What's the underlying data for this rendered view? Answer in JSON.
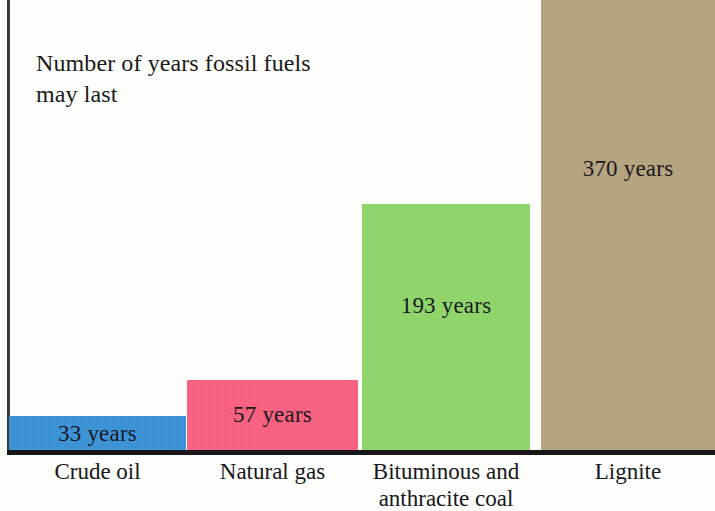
{
  "chart_data": {
    "type": "bar",
    "title": "Number of years fossil fuels\nmay last",
    "xlabel": "",
    "ylabel": "",
    "grid": false,
    "legend": "none",
    "ylim": [
      0,
      370
    ],
    "categories": [
      "Crude oil",
      "Natural gas",
      "Bituminous and\nanthracite coal",
      "Lignite"
    ],
    "values": [
      33,
      57,
      193,
      370
    ],
    "value_labels": [
      "33 years",
      "57 years",
      "193 years",
      "370 years"
    ],
    "colors": [
      "#3b92d6",
      "#f9617f",
      "#8ed66a",
      "#b5a47e"
    ],
    "units": "years"
  },
  "chart": {
    "title": "Number of years fossil fuels\nmay last",
    "bars": [
      {
        "name": "crude-oil",
        "category": "Crude oil",
        "value_label": "33 years",
        "value": 33,
        "color": "#3b92d6"
      },
      {
        "name": "natural-gas",
        "category": "Natural gas",
        "value_label": "57 years",
        "value": 57,
        "color": "#f9617f"
      },
      {
        "name": "bituminous-and-anthracite-coal",
        "category": "Bituminous and\nanthracite coal",
        "value_label": "193 years",
        "value": 193,
        "color": "#8ed66a"
      },
      {
        "name": "lignite",
        "category": "Lignite",
        "value_label": "370 years",
        "value": 370,
        "color": "#b5a47e"
      }
    ]
  }
}
